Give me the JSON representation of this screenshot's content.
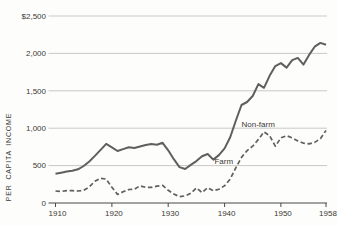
{
  "chart_data": {
    "type": "line",
    "title": "",
    "ylabel": "PER CAPITA INCOME",
    "xlabel": "",
    "grid": "horizontal",
    "legend_position": "inline-annotations",
    "y_axis": {
      "range": [
        0,
        2500
      ],
      "ticks": [
        0,
        500,
        1000,
        1500,
        2000,
        2500
      ],
      "tick_labels": [
        "0",
        "500",
        "1,000",
        "1,500",
        "2,000",
        "$2,500"
      ]
    },
    "x_axis": {
      "range": [
        1910,
        1958
      ],
      "ticks": [
        1910,
        1920,
        1930,
        1940,
        1950,
        1958
      ],
      "tick_labels": [
        "1910",
        "1920",
        "1930",
        "1940",
        "1950",
        "1958"
      ]
    },
    "years": [
      1910,
      1911,
      1912,
      1913,
      1914,
      1915,
      1916,
      1917,
      1918,
      1919,
      1920,
      1921,
      1922,
      1923,
      1924,
      1925,
      1926,
      1927,
      1928,
      1929,
      1930,
      1931,
      1932,
      1933,
      1934,
      1935,
      1936,
      1937,
      1938,
      1939,
      1940,
      1941,
      1942,
      1943,
      1944,
      1945,
      1946,
      1947,
      1948,
      1949,
      1950,
      1951,
      1952,
      1953,
      1954,
      1955,
      1956,
      1957,
      1958
    ],
    "series": [
      {
        "name": "Non-farm",
        "style": "solid",
        "values": [
          390,
          405,
          420,
          430,
          450,
          495,
          555,
          630,
          710,
          790,
          745,
          695,
          720,
          745,
          735,
          755,
          775,
          790,
          780,
          805,
          705,
          585,
          480,
          455,
          510,
          560,
          625,
          655,
          580,
          640,
          730,
          880,
          1100,
          1310,
          1350,
          1430,
          1590,
          1540,
          1700,
          1830,
          1870,
          1810,
          1910,
          1940,
          1850,
          1980,
          2090,
          2140,
          2115
        ]
      },
      {
        "name": "Farm",
        "style": "dashed",
        "values": [
          160,
          155,
          165,
          165,
          160,
          170,
          215,
          290,
          330,
          320,
          210,
          115,
          150,
          180,
          185,
          230,
          210,
          210,
          225,
          235,
          170,
          120,
          85,
          95,
          130,
          200,
          140,
          205,
          165,
          185,
          230,
          320,
          470,
          610,
          700,
          760,
          850,
          950,
          900,
          760,
          870,
          900,
          870,
          830,
          800,
          790,
          810,
          860,
          970
        ]
      }
    ],
    "annotations": [
      {
        "id": "nonfarm",
        "text": "Non-farm",
        "year": 1943.0,
        "value": 1020
      },
      {
        "id": "farm",
        "text": "Farm",
        "year": 1938.2,
        "value": 520
      }
    ],
    "colors": {
      "line": "#5f5f5d",
      "grid": "#c9c9c4",
      "axis": "#4a4944",
      "text": "#3b3a36",
      "background": "#fdfdfb"
    }
  }
}
